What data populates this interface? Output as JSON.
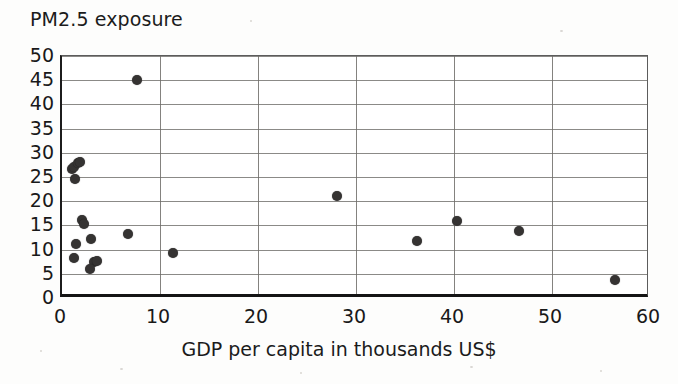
{
  "chart_data": {
    "type": "scatter",
    "title": "PM2.5 exposure",
    "xlabel": "GDP per capita in thousands US$",
    "ylabel": "PM2.5 exposure",
    "xlim": [
      0,
      60
    ],
    "ylim": [
      0,
      50
    ],
    "xticks": [
      0,
      10,
      20,
      30,
      40,
      50,
      60
    ],
    "yticks": [
      0,
      5,
      10,
      15,
      20,
      25,
      30,
      35,
      40,
      45,
      50
    ],
    "grid": "horizontal gridlines every 5 units, vertical gridlines every 10 units",
    "legend": "none",
    "marker": "filled dark circle",
    "marker_color": "#353332",
    "points": [
      {
        "x": 1.0,
        "y": 26.6
      },
      {
        "x": 1.2,
        "y": 27.0
      },
      {
        "x": 1.6,
        "y": 27.8
      },
      {
        "x": 1.8,
        "y": 28.0
      },
      {
        "x": 1.3,
        "y": 24.5
      },
      {
        "x": 2.0,
        "y": 16.1
      },
      {
        "x": 2.2,
        "y": 15.3
      },
      {
        "x": 6.7,
        "y": 13.2
      },
      {
        "x": 3.0,
        "y": 12.1
      },
      {
        "x": 1.4,
        "y": 11.2
      },
      {
        "x": 1.2,
        "y": 8.2
      },
      {
        "x": 3.3,
        "y": 7.5
      },
      {
        "x": 3.6,
        "y": 7.6
      },
      {
        "x": 2.9,
        "y": 5.9
      },
      {
        "x": 7.7,
        "y": 45.0
      },
      {
        "x": 11.3,
        "y": 9.3
      },
      {
        "x": 28.1,
        "y": 21.0
      },
      {
        "x": 36.2,
        "y": 11.8
      },
      {
        "x": 40.3,
        "y": 16.0
      },
      {
        "x": 46.6,
        "y": 13.8
      },
      {
        "x": 56.4,
        "y": 3.8
      }
    ]
  }
}
